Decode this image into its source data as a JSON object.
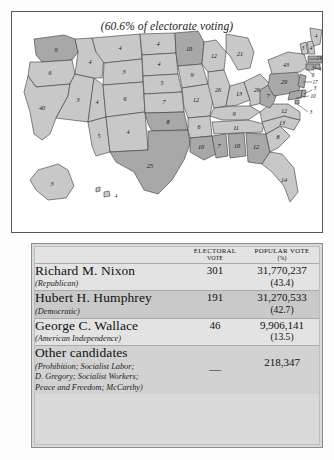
{
  "map": {
    "title": "(60.6% of electorate voting)",
    "legend_shades": {
      "nixon": "#c8c8c8",
      "humphrey": "#a8a8a8",
      "wallace": "#d8d8d8"
    },
    "states": [
      {
        "code": "WA",
        "ev": "9"
      },
      {
        "code": "OR",
        "ev": "6"
      },
      {
        "code": "CA",
        "ev": "40"
      },
      {
        "code": "NV",
        "ev": "3"
      },
      {
        "code": "ID",
        "ev": "4"
      },
      {
        "code": "MT",
        "ev": "4"
      },
      {
        "code": "WY",
        "ev": "3"
      },
      {
        "code": "UT",
        "ev": "4"
      },
      {
        "code": "AZ",
        "ev": "5"
      },
      {
        "code": "CO",
        "ev": "6"
      },
      {
        "code": "NM",
        "ev": "4"
      },
      {
        "code": "ND",
        "ev": "4"
      },
      {
        "code": "SD",
        "ev": "4"
      },
      {
        "code": "NE",
        "ev": "5"
      },
      {
        "code": "KS",
        "ev": "7"
      },
      {
        "code": "OK",
        "ev": "8"
      },
      {
        "code": "TX",
        "ev": "25"
      },
      {
        "code": "MN",
        "ev": "10"
      },
      {
        "code": "IA",
        "ev": "9"
      },
      {
        "code": "MO",
        "ev": "12"
      },
      {
        "code": "AR",
        "ev": "6"
      },
      {
        "code": "LA",
        "ev": "10"
      },
      {
        "code": "WI",
        "ev": "12"
      },
      {
        "code": "IL",
        "ev": "26"
      },
      {
        "code": "MS",
        "ev": "7"
      },
      {
        "code": "AL",
        "ev": "10"
      },
      {
        "code": "TN",
        "ev": "11"
      },
      {
        "code": "KY",
        "ev": "9"
      },
      {
        "code": "IN",
        "ev": "13"
      },
      {
        "code": "MI",
        "ev": "21"
      },
      {
        "code": "OH",
        "ev": "26"
      },
      {
        "code": "WV",
        "ev": "7"
      },
      {
        "code": "GA",
        "ev": "12"
      },
      {
        "code": "FL",
        "ev": "14"
      },
      {
        "code": "SC",
        "ev": "8"
      },
      {
        "code": "NC",
        "ev": "13"
      },
      {
        "code": "VA",
        "ev": "12"
      },
      {
        "code": "PA",
        "ev": "29"
      },
      {
        "code": "NY",
        "ev": "43"
      },
      {
        "code": "VT",
        "ev": "3"
      },
      {
        "code": "NH",
        "ev": "4"
      },
      {
        "code": "ME",
        "ev": "4"
      },
      {
        "code": "MA",
        "ev": "14"
      },
      {
        "code": "RI",
        "ev": "4"
      },
      {
        "code": "CT",
        "ev": "8"
      },
      {
        "code": "NJ",
        "ev": "17"
      },
      {
        "code": "DE",
        "ev": "3"
      },
      {
        "code": "MD",
        "ev": "10"
      },
      {
        "code": "DC",
        "ev": "3"
      },
      {
        "code": "AK",
        "ev": "3"
      },
      {
        "code": "HI",
        "ev": "4"
      }
    ]
  },
  "table": {
    "headers": {
      "name": "",
      "electoral": "ELECTORAL VOTE",
      "electoral_l1": "ELECTORAL",
      "electoral_l2": "VOTE",
      "popular_l1": "POPULAR VOTE",
      "popular_l2": "(%)"
    },
    "rows": [
      {
        "name": "Richard M. Nixon",
        "party": "(Republican)",
        "party_lines": [
          "(Republican)"
        ],
        "electoral": "301",
        "popular": "31,770,237",
        "percent": "(43.4)"
      },
      {
        "name": "Hubert H. Humphrey",
        "party": "(Democratic)",
        "party_lines": [
          "(Democratic)"
        ],
        "electoral": "191",
        "popular": "31,270,533",
        "percent": "(42.7)"
      },
      {
        "name": "George C. Wallace",
        "party": "(American Independence)",
        "party_lines": [
          "(American Independence)"
        ],
        "electoral": "46",
        "popular": "9,906,141",
        "percent": "(13.5)"
      },
      {
        "name": "Other candidates",
        "party": "(Prohibition; Socialist Labor; D. Gregory; Socialist Workers; Peace and Freedom; McCarthy)",
        "party_lines": [
          "(Prohibition; Socialist Labor;",
          "D. Gregory; Socialist Workers;",
          "Peace and Freedom; McCarthy)"
        ],
        "electoral": "—",
        "popular": "218,347",
        "percent": ""
      }
    ]
  }
}
